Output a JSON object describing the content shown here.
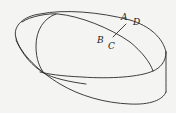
{
  "diagram": {
    "stroke_color": "#2a2a2a",
    "background_color": "#f4f4f2",
    "labels": {
      "A": "A",
      "B": "B",
      "C": "C",
      "D": "D"
    },
    "segments": [
      {
        "from": "A",
        "to": "C"
      }
    ]
  }
}
